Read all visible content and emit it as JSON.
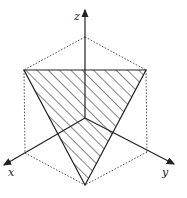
{
  "diagram": {
    "type": "3d-coordinate-plane-section",
    "axes": {
      "x": {
        "label": "x"
      },
      "y": {
        "label": "y"
      },
      "z": {
        "label": "z"
      }
    },
    "shaded_region": "triangle",
    "colors": {
      "line": "#222222",
      "dotted": "#444444",
      "background": "#ffffff"
    }
  }
}
